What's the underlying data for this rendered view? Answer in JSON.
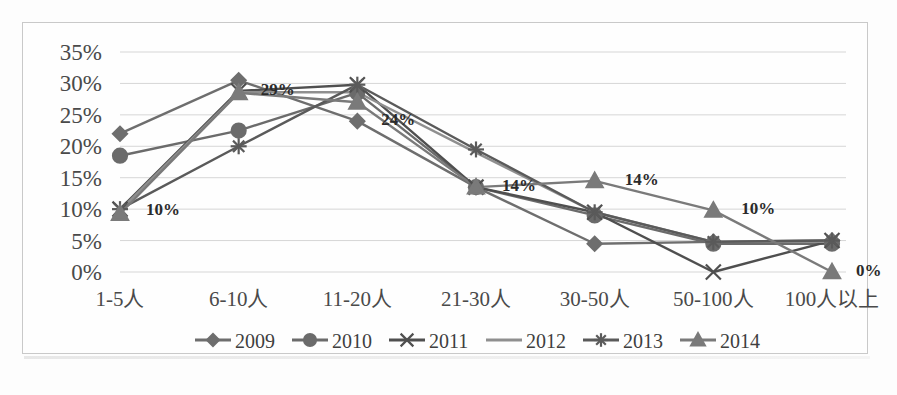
{
  "chart_data": {
    "type": "line",
    "title": "",
    "subtitle": "",
    "xlabel": "",
    "ylabel": "",
    "categories": [
      "1-5人",
      "6-10人",
      "11-20人",
      "21-30人",
      "30-50人",
      "50-100人",
      "100人以上"
    ],
    "ylim": [
      0,
      35
    ],
    "ytick_values": [
      0,
      5,
      10,
      15,
      20,
      25,
      30,
      35
    ],
    "ytick_labels": [
      "0%",
      "5%",
      "10%",
      "15%",
      "20%",
      "25%",
      "30%",
      "35%"
    ],
    "grid": true,
    "legend_position": "bottom",
    "series": [
      {
        "name": "2009",
        "marker": "diamond",
        "color": "#6e6e6e",
        "values": [
          22.0,
          30.5,
          24.0,
          13.5,
          4.5,
          4.8,
          5.0
        ]
      },
      {
        "name": "2010",
        "marker": "circle",
        "color": "#6b6b6b",
        "values": [
          18.5,
          22.5,
          28.5,
          13.5,
          9.0,
          4.5,
          4.5
        ]
      },
      {
        "name": "2011",
        "marker": "x",
        "color": "#4f4f4f",
        "values": [
          10.0,
          28.8,
          29.8,
          13.5,
          9.5,
          0.0,
          5.0
        ]
      },
      {
        "name": "2012",
        "marker": "none",
        "color": "#8f8f8f",
        "values": [
          9.8,
          28.6,
          28.6,
          19.0,
          9.5,
          4.8,
          4.8
        ]
      },
      {
        "name": "2013",
        "marker": "asterisk",
        "color": "#5a5a5a",
        "values": [
          10.0,
          20.0,
          29.8,
          19.5,
          9.5,
          4.8,
          5.0
        ]
      },
      {
        "name": "2014",
        "marker": "triangle",
        "color": "#7a7a7a",
        "values": [
          9.3,
          28.5,
          27.0,
          13.5,
          14.5,
          9.8,
          0.0
        ]
      }
    ],
    "annotations": [
      {
        "text": "10%",
        "category": "1-5人",
        "value": 10.0,
        "dx": 26,
        "dy": 6
      },
      {
        "text": "29%",
        "category": "6-10人",
        "value": 29.0,
        "dx": 22,
        "dy": 5
      },
      {
        "text": "24%",
        "category": "11-20人",
        "value": 24.0,
        "dx": 24,
        "dy": 4
      },
      {
        "text": "14%",
        "category": "21-30人",
        "value": 13.5,
        "dx": 26,
        "dy": 4
      },
      {
        "text": "14%",
        "category": "30-50人",
        "value": 14.5,
        "dx": 30,
        "dy": 4
      },
      {
        "text": "10%",
        "category": "50-100人",
        "value": 9.8,
        "dx": 28,
        "dy": 4
      },
      {
        "text": "0%",
        "category": "100人以上",
        "value": 0.0,
        "dx": 24,
        "dy": 4
      }
    ]
  }
}
